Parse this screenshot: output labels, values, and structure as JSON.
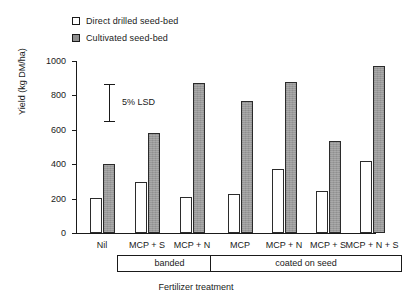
{
  "chart_data": {
    "type": "bar",
    "title": "",
    "xlabel": "Fertilizer treatment",
    "ylabel": "Yield (kg DM/ha)",
    "ylim": [
      0,
      1000
    ],
    "yticks": [
      0,
      200,
      400,
      600,
      800,
      1000
    ],
    "grid": false,
    "legend_position": "top-left",
    "categories": [
      "Nil",
      "MCP + S",
      "MCP + N",
      "MCP",
      "MCP + N",
      "MCP + S",
      "MCP + N + S"
    ],
    "series": [
      {
        "name": "Direct drilled seed-bed",
        "color": "#ffffff",
        "values": [
          205,
          298,
          208,
          228,
          372,
          245,
          418
        ]
      },
      {
        "name": "Cultivated seed-bed",
        "color": "#9a9a9a",
        "values": [
          400,
          583,
          870,
          768,
          878,
          533,
          970
        ]
      }
    ],
    "annotations": [
      {
        "name": "lsd",
        "label": "5% LSD",
        "low": 650,
        "high": 865
      }
    ],
    "group_brackets": [
      {
        "label": "banded",
        "categories": [
          "MCP + S",
          "MCP + N"
        ]
      },
      {
        "label": "coated on seed",
        "categories": [
          "MCP",
          "MCP + N",
          "MCP + S",
          "MCP + N + S"
        ]
      }
    ]
  },
  "legend": {
    "items": [
      {
        "label": "Direct drilled seed-bed",
        "marker": "open-square"
      },
      {
        "label": "Cultivated seed-bed",
        "marker": "filled-square"
      }
    ]
  },
  "axes": {
    "y_title": "Yield (kg DM/ha)",
    "x_title": "Fertilizer treatment",
    "y_ticklabels": [
      "1000",
      "800",
      "600",
      "400",
      "200",
      "0"
    ]
  }
}
